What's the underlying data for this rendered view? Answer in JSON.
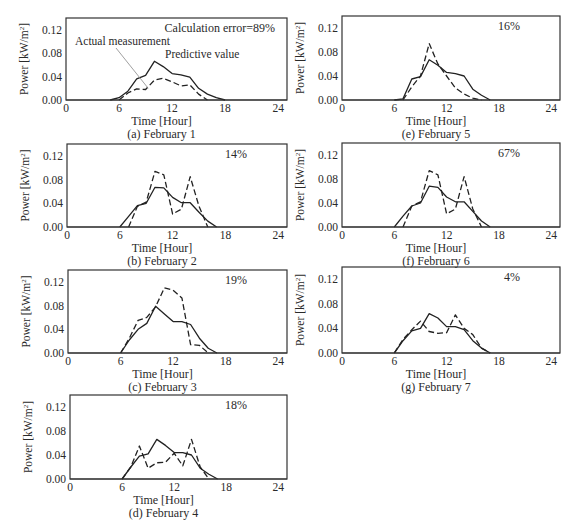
{
  "figure": {
    "panels_layout": "two-column grid, left column (a)-(d), right column (e)-(g)"
  },
  "labels": {
    "y_axis": "Power [kW/m",
    "y_axis_sup": "2",
    "y_axis_close": "]",
    "x_axis": "Time [Hour]",
    "legend_actual": "Actual measurement",
    "legend_predictive": "Predictive value"
  },
  "axis": {
    "x_ticks": [
      "0",
      "6",
      "12",
      "18",
      "24"
    ],
    "y_ticks": [
      "0.00",
      "0.04",
      "0.08",
      "0.12"
    ]
  },
  "chart_data": [
    {
      "type": "line",
      "id": "a",
      "caption": "(a) February 1",
      "annotation": "Calculation error=89%",
      "xlabel": "Time [Hour]",
      "ylabel": "Power [kW/m2]",
      "xlim": [
        0,
        25
      ],
      "ylim": [
        0,
        0.14
      ],
      "box": {
        "x": 66,
        "y": 18,
        "w": 221,
        "h": 82
      },
      "series": [
        {
          "name": "Actual measurement",
          "style": "solid",
          "x": [
            5,
            6,
            7,
            8,
            9,
            10,
            11,
            12,
            13,
            14,
            15,
            16,
            17,
            18
          ],
          "values": [
            0,
            0.004,
            0.015,
            0.036,
            0.042,
            0.066,
            0.057,
            0.045,
            0.043,
            0.039,
            0.02,
            0.01,
            0.004,
            0
          ]
        },
        {
          "name": "Predictive value",
          "style": "dashed",
          "x": [
            6,
            7,
            8,
            9,
            10,
            11,
            12,
            13,
            14,
            15,
            16
          ],
          "values": [
            0,
            0.012,
            0.019,
            0.018,
            0.034,
            0.037,
            0.031,
            0.024,
            0.026,
            0.01,
            0
          ]
        }
      ]
    },
    {
      "type": "line",
      "id": "b",
      "caption": "(b) February 2",
      "annotation": "14%",
      "xlabel": "Time [Hour]",
      "ylabel": "Power [kW/m2]",
      "xlim": [
        0,
        25
      ],
      "ylim": [
        0,
        0.14
      ],
      "box": {
        "x": 67,
        "y": 144,
        "w": 220,
        "h": 83
      },
      "series": [
        {
          "name": "Actual measurement",
          "style": "solid",
          "x": [
            6,
            7,
            8,
            9,
            10,
            11,
            12,
            13,
            14,
            15,
            16,
            17
          ],
          "values": [
            0,
            0.018,
            0.036,
            0.04,
            0.067,
            0.066,
            0.05,
            0.041,
            0.041,
            0.025,
            0.01,
            0
          ]
        },
        {
          "name": "Predictive value",
          "style": "dashed",
          "x": [
            7,
            8,
            9,
            10,
            11,
            12,
            13,
            14,
            15,
            16
          ],
          "values": [
            0,
            0.035,
            0.042,
            0.094,
            0.088,
            0.022,
            0.03,
            0.085,
            0.035,
            0
          ]
        }
      ]
    },
    {
      "type": "line",
      "id": "c",
      "caption": "(c) February 3",
      "annotation": "19%",
      "xlabel": "Time [Hour]",
      "ylabel": "Power [kW/m2]",
      "xlim": [
        0,
        25
      ],
      "ylim": [
        0,
        0.14
      ],
      "box": {
        "x": 68,
        "y": 270,
        "w": 219,
        "h": 83
      },
      "series": [
        {
          "name": "Actual measurement",
          "style": "solid",
          "x": [
            6,
            7,
            8,
            9,
            10,
            11,
            12,
            13,
            14,
            15,
            16,
            17
          ],
          "values": [
            0,
            0.022,
            0.04,
            0.05,
            0.079,
            0.066,
            0.053,
            0.053,
            0.048,
            0.025,
            0.008,
            0
          ]
        },
        {
          "name": "Predictive value",
          "style": "dashed",
          "x": [
            6,
            7,
            8,
            9,
            10,
            11,
            12,
            13,
            14,
            15,
            16
          ],
          "values": [
            0,
            0.025,
            0.055,
            0.06,
            0.078,
            0.11,
            0.106,
            0.093,
            0.014,
            0.013,
            0
          ]
        }
      ]
    },
    {
      "type": "line",
      "id": "d",
      "caption": "(d) February 4",
      "annotation": "18%",
      "xlabel": "Time [Hour]",
      "ylabel": "Power [kW/m2]",
      "xlim": [
        0,
        25
      ],
      "ylim": [
        0,
        0.14
      ],
      "box": {
        "x": 70,
        "y": 395,
        "w": 217,
        "h": 84
      },
      "series": [
        {
          "name": "Actual measurement",
          "style": "solid",
          "x": [
            6,
            7,
            8,
            9,
            10,
            11,
            12,
            13,
            14,
            15,
            16,
            17
          ],
          "values": [
            0,
            0.02,
            0.038,
            0.042,
            0.066,
            0.056,
            0.044,
            0.044,
            0.04,
            0.018,
            0.008,
            0
          ]
        },
        {
          "name": "Predictive value",
          "style": "dashed",
          "x": [
            6,
            7,
            8,
            9,
            10,
            11,
            12,
            13,
            14,
            15,
            16
          ],
          "values": [
            0,
            0.02,
            0.055,
            0.018,
            0.027,
            0.028,
            0.043,
            0.022,
            0.066,
            0.02,
            0
          ]
        }
      ]
    },
    {
      "type": "line",
      "id": "e",
      "caption": "(e) February 5",
      "annotation": "16%",
      "xlabel": "Time [Hour]",
      "ylabel": "Power [kW/m2]",
      "xlim": [
        0,
        25
      ],
      "ylim": [
        0,
        0.14
      ],
      "box": {
        "x": 342,
        "y": 16,
        "w": 218,
        "h": 84
      },
      "series": [
        {
          "name": "Actual measurement",
          "style": "solid",
          "x": [
            6,
            7,
            8,
            9,
            10,
            11,
            12,
            13,
            14,
            15,
            16,
            17
          ],
          "values": [
            0,
            0.002,
            0.035,
            0.039,
            0.067,
            0.058,
            0.046,
            0.044,
            0.04,
            0.018,
            0.008,
            0
          ]
        },
        {
          "name": "Predictive value",
          "style": "dashed",
          "x": [
            7,
            8,
            9,
            10,
            11,
            12,
            13,
            14,
            15,
            16
          ],
          "values": [
            0,
            0.022,
            0.04,
            0.094,
            0.06,
            0.04,
            0.02,
            0.01,
            0.003,
            0
          ]
        }
      ]
    },
    {
      "type": "line",
      "id": "f",
      "caption": "(f) February 6",
      "annotation": "67%",
      "xlabel": "Time [Hour]",
      "ylabel": "Power [kW/m2]",
      "xlim": [
        0,
        25
      ],
      "ylim": [
        0,
        0.14
      ],
      "box": {
        "x": 342,
        "y": 143,
        "w": 218,
        "h": 84
      },
      "series": [
        {
          "name": "Actual measurement",
          "style": "solid",
          "x": [
            6,
            7,
            8,
            9,
            10,
            11,
            12,
            13,
            14,
            15,
            16,
            17
          ],
          "values": [
            0,
            0.018,
            0.035,
            0.04,
            0.068,
            0.066,
            0.05,
            0.042,
            0.042,
            0.026,
            0.01,
            0
          ]
        },
        {
          "name": "Predictive value",
          "style": "dashed",
          "x": [
            7,
            8,
            9,
            10,
            11,
            12,
            13,
            14,
            15,
            16
          ],
          "values": [
            0,
            0.035,
            0.042,
            0.094,
            0.087,
            0.022,
            0.03,
            0.084,
            0.03,
            0
          ]
        }
      ]
    },
    {
      "type": "line",
      "id": "g",
      "caption": "(g) February 7",
      "annotation": "4%",
      "xlabel": "Time [Hour]",
      "ylabel": "Power [kW/m2]",
      "xlim": [
        0,
        25
      ],
      "ylim": [
        0,
        0.14
      ],
      "box": {
        "x": 342,
        "y": 267,
        "w": 218,
        "h": 86
      },
      "series": [
        {
          "name": "Actual measurement",
          "style": "solid",
          "x": [
            6,
            7,
            8,
            9,
            10,
            11,
            12,
            13,
            14,
            15,
            16,
            17
          ],
          "values": [
            0,
            0.02,
            0.036,
            0.04,
            0.064,
            0.057,
            0.043,
            0.043,
            0.038,
            0.02,
            0.008,
            0
          ]
        },
        {
          "name": "Predictive value",
          "style": "dashed",
          "x": [
            6,
            7,
            8,
            9,
            10,
            11,
            12,
            13,
            14,
            15,
            16,
            17
          ],
          "values": [
            0,
            0.022,
            0.038,
            0.052,
            0.035,
            0.032,
            0.033,
            0.062,
            0.04,
            0.03,
            0.008,
            0
          ]
        }
      ]
    }
  ]
}
